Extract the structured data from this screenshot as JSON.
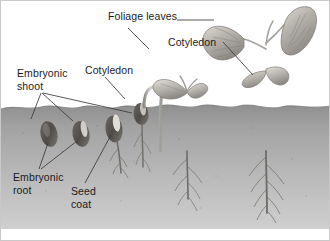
{
  "figure": {
    "alt": "Diagram showing stages of bean seed germination from seed to mature seedling with foliage leaves"
  },
  "labels": {
    "foliage_leaves": "Foliage leaves",
    "cotyledon_top": "Cotyledon",
    "cotyledon_mid": "Cotyledon",
    "embryonic_shoot": "Embryonic\nshoot",
    "embryonic_root": "Embryonic\nroot",
    "seed_coat": "Seed\ncoat"
  },
  "colors": {
    "soil_top": "#9a9a9a",
    "soil_bottom": "#c9c9c9",
    "sky": "#ffffff",
    "leader_line": "#3a3a3a",
    "text": "#1a1a1a",
    "seed_dark": "#55514e",
    "seed_light": "#d8d4cf",
    "stem": "#b9b6b0",
    "leaf": "#b3b0aa",
    "root": "#6f6c68",
    "border": "#c9c9c9"
  },
  "scene": {
    "soil_line_y": 105,
    "soil_bottom_y": 228,
    "stages": [
      {
        "name": "seed-dormant-1",
        "label_ref": "embryonic_shoot"
      },
      {
        "name": "seed-dormant-2",
        "label_ref": "embryonic_root"
      },
      {
        "name": "seed-germinating",
        "label_ref": "seed_coat"
      },
      {
        "name": "seedling-hooked",
        "label_ref": "cotyledon_mid"
      },
      {
        "name": "seedling-cotyledons",
        "label_ref": "cotyledon_top"
      },
      {
        "name": "plant-foliage",
        "label_ref": "foliage_leaves"
      }
    ]
  }
}
